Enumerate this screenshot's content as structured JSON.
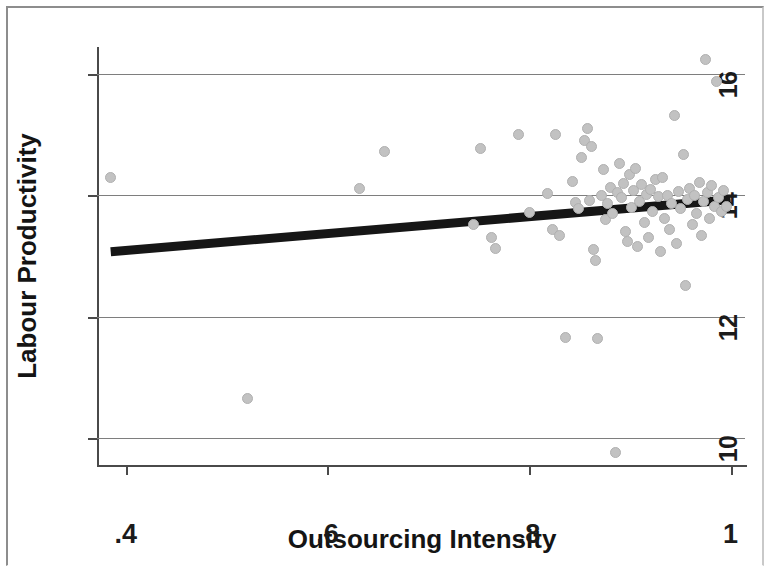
{
  "chart_data": {
    "type": "scatter",
    "title": "",
    "xlabel": "Outsourcing Intensity",
    "ylabel": "Labour Productivity",
    "xlim": [
      0.3714,
      1.0143
    ],
    "ylim": [
      9.55,
      16.45
    ],
    "xticks": [
      0.4,
      0.6,
      0.8,
      1
    ],
    "xtick_labels": [
      ".4",
      ".6",
      ".8",
      "1"
    ],
    "yticks": [
      10,
      12,
      14,
      16
    ],
    "ytick_labels": [
      "10",
      "12",
      "14",
      "16"
    ],
    "grid": "horizontal",
    "legend": "none",
    "marker_color": "#c2c2c2",
    "fit_line_color": "#161616",
    "gridline_color": "#7e7e7e",
    "axis_color": "#4a4a4a",
    "fit_line": {
      "label": "linear fit",
      "x_start": 0.385,
      "y_start": 13.07,
      "x_end": 1.0,
      "y_end": 13.93
    },
    "points": [
      [
        0.385,
        14.3
      ],
      [
        0.521,
        10.65
      ],
      [
        0.632,
        14.12
      ],
      [
        0.657,
        14.72
      ],
      [
        0.745,
        13.52
      ],
      [
        0.752,
        14.78
      ],
      [
        0.763,
        13.3
      ],
      [
        0.767,
        13.13
      ],
      [
        0.79,
        15.0
      ],
      [
        0.8,
        13.72
      ],
      [
        0.818,
        14.03
      ],
      [
        0.823,
        13.44
      ],
      [
        0.826,
        15.0
      ],
      [
        0.83,
        13.34
      ],
      [
        0.836,
        11.65
      ],
      [
        0.843,
        14.23
      ],
      [
        0.846,
        13.88
      ],
      [
        0.849,
        13.78
      ],
      [
        0.852,
        14.62
      ],
      [
        0.855,
        14.9
      ],
      [
        0.858,
        15.1
      ],
      [
        0.86,
        13.92
      ],
      [
        0.862,
        14.8
      ],
      [
        0.864,
        13.1
      ],
      [
        0.866,
        12.92
      ],
      [
        0.868,
        11.63
      ],
      [
        0.872,
        14.0
      ],
      [
        0.874,
        14.42
      ],
      [
        0.876,
        13.6
      ],
      [
        0.878,
        13.86
      ],
      [
        0.881,
        14.13
      ],
      [
        0.883,
        13.7
      ],
      [
        0.886,
        9.75
      ],
      [
        0.888,
        14.05
      ],
      [
        0.89,
        14.52
      ],
      [
        0.892,
        13.96
      ],
      [
        0.894,
        14.2
      ],
      [
        0.896,
        13.4
      ],
      [
        0.898,
        13.24
      ],
      [
        0.9,
        14.35
      ],
      [
        0.902,
        13.8
      ],
      [
        0.904,
        14.08
      ],
      [
        0.906,
        14.45
      ],
      [
        0.908,
        13.16
      ],
      [
        0.91,
        13.9
      ],
      [
        0.912,
        14.18
      ],
      [
        0.915,
        13.55
      ],
      [
        0.917,
        14.02
      ],
      [
        0.919,
        13.3
      ],
      [
        0.921,
        14.1
      ],
      [
        0.923,
        13.74
      ],
      [
        0.926,
        14.26
      ],
      [
        0.928,
        13.98
      ],
      [
        0.93,
        13.08
      ],
      [
        0.932,
        14.3
      ],
      [
        0.934,
        13.62
      ],
      [
        0.937,
        14.0
      ],
      [
        0.939,
        13.44
      ],
      [
        0.941,
        13.86
      ],
      [
        0.944,
        15.32
      ],
      [
        0.946,
        13.2
      ],
      [
        0.948,
        14.06
      ],
      [
        0.95,
        13.78
      ],
      [
        0.953,
        14.68
      ],
      [
        0.955,
        12.52
      ],
      [
        0.957,
        13.94
      ],
      [
        0.959,
        14.12
      ],
      [
        0.962,
        13.52
      ],
      [
        0.964,
        14.0
      ],
      [
        0.966,
        13.7
      ],
      [
        0.969,
        14.22
      ],
      [
        0.971,
        13.34
      ],
      [
        0.973,
        13.9
      ],
      [
        0.975,
        16.25
      ],
      [
        0.977,
        14.04
      ],
      [
        0.979,
        13.62
      ],
      [
        0.981,
        14.16
      ],
      [
        0.984,
        13.82
      ],
      [
        0.986,
        15.88
      ],
      [
        0.988,
        13.96
      ],
      [
        0.991,
        13.74
      ],
      [
        0.993,
        14.08
      ],
      [
        0.996,
        13.82
      ]
    ]
  }
}
